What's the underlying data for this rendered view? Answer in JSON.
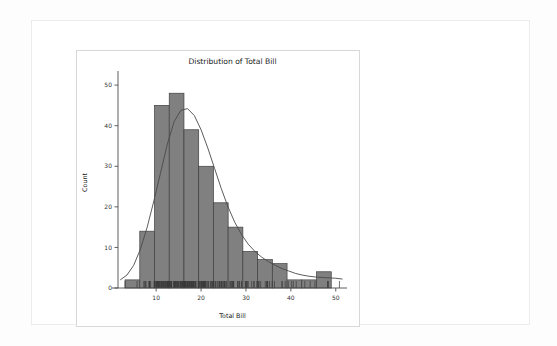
{
  "card": {
    "name": "plot-output-card"
  },
  "chart_data": {
    "type": "bar",
    "title": "Distribution of Total Bill",
    "xlabel": "Total Bill",
    "ylabel": "Count",
    "grid": false,
    "legend": null,
    "xlim": [
      1.5,
      52.5
    ],
    "ylim": [
      0,
      52
    ],
    "xticks": [
      10,
      20,
      30,
      40,
      50
    ],
    "xtick_labels": [
      "10",
      "20",
      "30",
      "40",
      "50"
    ],
    "yticks": [
      0,
      10,
      20,
      30,
      40,
      50
    ],
    "ytick_labels": [
      "0",
      "10",
      "20",
      "30",
      "40",
      "50"
    ],
    "bar_color": "#808080",
    "bar_edge_color": "#3f3f3f",
    "kde_color": "#4a4a4a",
    "bin_edges": [
      3.07,
      6.35,
      9.63,
      12.91,
      16.19,
      19.47,
      22.75,
      26.03,
      29.31,
      32.59,
      35.87,
      39.15,
      42.43,
      45.71,
      48.99
    ],
    "categories": [
      "3.1-6.4",
      "6.4-9.6",
      "9.6-12.9",
      "12.9-16.2",
      "16.2-19.5",
      "19.5-22.8",
      "22.8-26.0",
      "26.0-29.3",
      "29.3-32.6",
      "32.6-35.9",
      "35.9-39.2",
      "39.2-42.4",
      "42.4-45.7",
      "45.7-49.0"
    ],
    "values": [
      2,
      14,
      45,
      48,
      39,
      30,
      21,
      15,
      9,
      7,
      6,
      2,
      2,
      4
    ],
    "kde_curve": {
      "x": [
        2.0,
        3.5,
        5.0,
        6.5,
        8.0,
        9.5,
        11.0,
        12.5,
        14.0,
        15.5,
        17.0,
        18.5,
        20.0,
        21.5,
        23.0,
        24.5,
        26.0,
        27.5,
        29.0,
        30.5,
        32.0,
        33.5,
        35.0,
        36.5,
        38.0,
        39.5,
        41.0,
        42.5,
        44.0,
        45.5,
        47.0,
        48.5,
        50.0,
        51.5
      ],
      "y": [
        2.0,
        3.2,
        5.6,
        9.6,
        15.0,
        21.5,
        28.5,
        35.5,
        41.0,
        43.8,
        44.2,
        42.5,
        39.0,
        34.5,
        29.5,
        24.5,
        20.0,
        16.2,
        13.2,
        10.8,
        9.0,
        7.6,
        6.5,
        5.6,
        4.8,
        4.2,
        3.6,
        3.2,
        2.9,
        2.7,
        2.6,
        2.5,
        2.4,
        2.2
      ]
    },
    "rug": {
      "visible": true,
      "x": [
        3.07,
        5.75,
        7.25,
        7.51,
        7.56,
        7.74,
        8.35,
        8.51,
        8.52,
        8.58,
        8.77,
        9.55,
        9.6,
        9.68,
        9.78,
        9.94,
        10.07,
        10.09,
        10.27,
        10.29,
        10.33,
        10.34,
        10.51,
        10.59,
        10.63,
        10.65,
        10.77,
        10.9,
        11.02,
        11.17,
        11.24,
        11.35,
        11.38,
        11.59,
        11.61,
        11.69,
        11.87,
        12.02,
        12.03,
        12.16,
        12.26,
        12.43,
        12.46,
        12.48,
        12.54,
        12.6,
        12.66,
        12.69,
        12.74,
        12.76,
        12.9,
        13.0,
        13.03,
        13.13,
        13.27,
        13.28,
        13.37,
        13.39,
        13.42,
        13.81,
        13.94,
        14.0,
        14.07,
        14.15,
        14.26,
        14.31,
        14.48,
        14.52,
        14.73,
        14.78,
        14.83,
        15.01,
        15.04,
        15.06,
        15.36,
        15.38,
        15.42,
        15.48,
        15.53,
        15.69,
        15.77,
        15.81,
        15.95,
        15.98,
        16.0,
        16.04,
        16.21,
        16.27,
        16.29,
        16.31,
        16.32,
        16.4,
        16.43,
        16.45,
        16.47,
        16.49,
        16.58,
        16.66,
        16.82,
        16.93,
        16.97,
        16.99,
        17.07,
        17.26,
        17.29,
        17.31,
        17.46,
        17.47,
        17.51,
        17.59,
        17.78,
        17.81,
        17.82,
        17.89,
        17.92,
        18.04,
        18.15,
        18.24,
        18.26,
        18.28,
        18.29,
        18.35,
        18.43,
        18.64,
        18.69,
        18.71,
        18.78,
        19.08,
        19.44,
        19.49,
        19.65,
        19.81,
        19.82,
        20.08,
        20.09,
        20.23,
        20.29,
        20.45,
        20.49,
        20.53,
        20.65,
        20.69,
        20.76,
        20.9,
        20.92,
        21.01,
        21.16,
        21.5,
        21.58,
        21.7,
        22.12,
        22.23,
        22.42,
        22.49,
        22.67,
        22.75,
        22.76,
        23.1,
        23.17,
        23.33,
        23.68,
        24.01,
        24.06,
        24.08,
        24.27,
        24.52,
        24.55,
        24.59,
        24.71,
        25.0,
        25.21,
        25.28,
        25.29,
        25.56,
        25.71,
        26.41,
        26.59,
        26.86,
        26.88,
        27.05,
        27.18,
        27.2,
        27.28,
        28.15,
        28.17,
        28.44,
        28.55,
        28.97,
        29.03,
        29.85,
        29.93,
        30.06,
        30.14,
        30.4,
        30.46,
        31.27,
        31.71,
        31.85,
        32.4,
        32.68,
        32.83,
        32.9,
        33.27,
        34.3,
        34.63,
        34.65,
        34.81,
        34.83,
        35.26,
        35.83,
        36.34,
        38.01,
        38.07,
        38.73,
        39.42,
        40.17,
        40.55,
        41.19,
        43.11,
        44.3,
        45.35,
        48.17,
        48.27,
        48.33,
        50.81
      ]
    }
  }
}
